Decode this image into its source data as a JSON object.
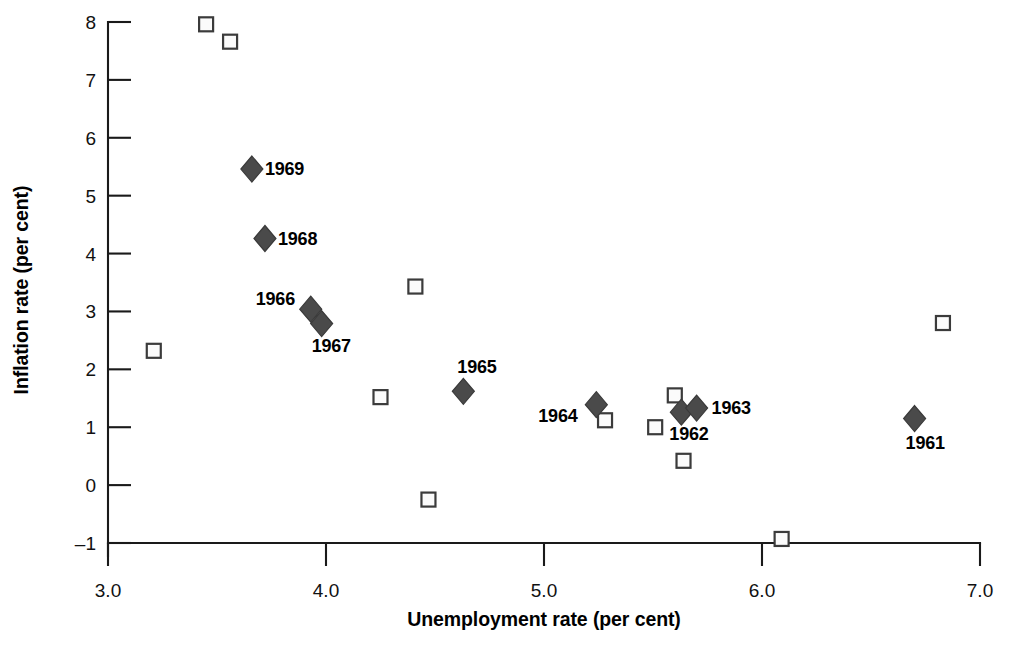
{
  "chart_data": {
    "type": "scatter",
    "title": "",
    "xlabel": "Unemployment rate (per cent)",
    "ylabel": "Inflation rate (per cent)",
    "xlim": [
      3.0,
      7.0
    ],
    "ylim": [
      -1,
      8
    ],
    "grid": false,
    "legend": "none",
    "xticks": [
      "3.0",
      "4.0",
      "5.0",
      "6.0",
      "7.0"
    ],
    "xtick_values": [
      3.0,
      4.0,
      5.0,
      6.0,
      7.0
    ],
    "yticks": [
      "8",
      "7",
      "6",
      "5",
      "4",
      "3",
      "2",
      "1",
      "0",
      "-1"
    ],
    "ytick_values": [
      8,
      7,
      6,
      5,
      4,
      3,
      2,
      1,
      0,
      -1
    ],
    "series": [
      {
        "name": "labelled-years",
        "marker": "filled-diamond",
        "color": "#4a4a4a",
        "points": [
          {
            "label": "1969",
            "x": 3.66,
            "y": 5.46,
            "label_dx": 13,
            "label_dy": 6
          },
          {
            "label": "1968",
            "x": 3.72,
            "y": 4.26,
            "label_dx": 13,
            "label_dy": 6
          },
          {
            "label": "1966",
            "x": 3.93,
            "y": 3.04,
            "label_dx": -55,
            "label_dy": -4
          },
          {
            "label": "1967",
            "x": 3.98,
            "y": 2.79,
            "label_dx": -10,
            "label_dy": 28
          },
          {
            "label": "1965",
            "x": 4.63,
            "y": 1.62,
            "label_dx": -6,
            "label_dy": -18
          },
          {
            "label": "1964",
            "x": 5.24,
            "y": 1.39,
            "label_dx": -58,
            "label_dy": 17
          },
          {
            "label": "1962",
            "x": 5.63,
            "y": 1.26,
            "label_dx": -12,
            "label_dy": 28
          },
          {
            "label": "1963",
            "x": 5.7,
            "y": 1.33,
            "label_dx": 15,
            "label_dy": 6
          },
          {
            "label": "1961",
            "x": 6.7,
            "y": 1.15,
            "label_dx": -9,
            "label_dy": 30
          }
        ]
      },
      {
        "name": "unlabelled-observations",
        "marker": "open-square",
        "color": "#3b3b3b",
        "points": [
          {
            "x": 3.45,
            "y": 7.96
          },
          {
            "x": 3.56,
            "y": 7.66
          },
          {
            "x": 3.21,
            "y": 2.32
          },
          {
            "x": 4.41,
            "y": 3.43
          },
          {
            "x": 4.25,
            "y": 1.52
          },
          {
            "x": 4.47,
            "y": -0.25
          },
          {
            "x": 5.28,
            "y": 1.12
          },
          {
            "x": 5.51,
            "y": 1.0
          },
          {
            "x": 5.6,
            "y": 1.55
          },
          {
            "x": 5.64,
            "y": 0.42
          },
          {
            "x": 6.09,
            "y": -0.93
          },
          {
            "x": 6.83,
            "y": 2.8
          }
        ]
      }
    ]
  }
}
